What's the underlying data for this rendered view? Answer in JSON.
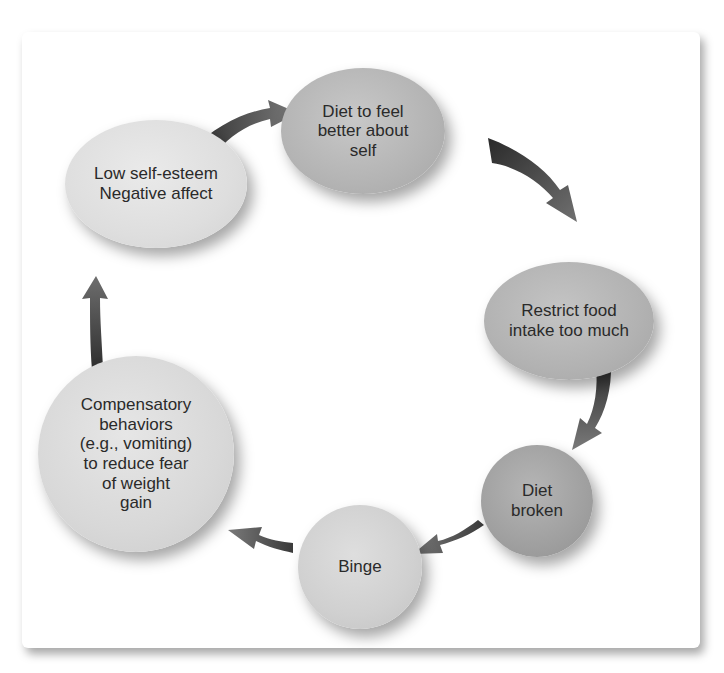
{
  "diagram": {
    "type": "cycle",
    "nodes": [
      {
        "id": "diet",
        "label": "Diet to feel\nbetter about\nself"
      },
      {
        "id": "restrict",
        "label": "Restrict food\nintake too much"
      },
      {
        "id": "broken",
        "label": "Diet\nbroken"
      },
      {
        "id": "binge",
        "label": "Binge"
      },
      {
        "id": "compensatory",
        "label": "Compensatory\nbehaviors\n(e.g., vomiting)\nto reduce fear\nof weight\ngain"
      },
      {
        "id": "low",
        "label": "Low self-esteem\nNegative affect"
      }
    ],
    "edges": [
      {
        "from": "low",
        "to": "diet"
      },
      {
        "from": "diet",
        "to": "restrict"
      },
      {
        "from": "restrict",
        "to": "broken"
      },
      {
        "from": "broken",
        "to": "binge"
      },
      {
        "from": "binge",
        "to": "compensatory"
      },
      {
        "from": "compensatory",
        "to": "low"
      }
    ],
    "colors": {
      "arrow_dark": "#3a3a3a",
      "arrow_mid": "#6a6a6a",
      "text": "#2a2a2a",
      "panel": "#ffffff"
    }
  }
}
